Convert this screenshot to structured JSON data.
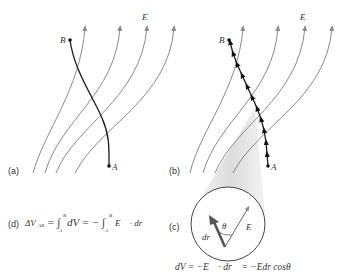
{
  "panels": {
    "a": {
      "label": "(a)",
      "point_start": "A",
      "point_end": "B"
    },
    "b": {
      "label": "(b)",
      "point_start": "A",
      "point_end": "B"
    },
    "c": {
      "label": "(c)",
      "theta": "θ",
      "dr": "dr⃗",
      "E": "E⃗"
    },
    "d": {
      "label": "(d)"
    }
  },
  "field_label": "E⃗",
  "equations": {
    "d_lhs": "ΔV",
    "d_sub": "AB",
    "d_rest1": "= ∫",
    "d_up1": "B",
    "d_low1": "A",
    "d_mid": "dV = − ∫",
    "d_up2": "B",
    "d_low2": "A",
    "d_tail": "E⃗ · dr⃗",
    "c_eq": "dV = −E⃗ · dr⃗ = −Edr cosθ"
  },
  "colors": {
    "field_line": "#8a8a8a",
    "path": "#1a1a1a",
    "cone": "#e6e6e6"
  }
}
